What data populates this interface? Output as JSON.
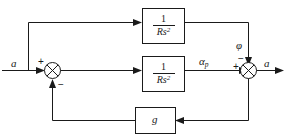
{
  "diagram": {
    "type": "control-system-block-diagram",
    "colors": {
      "line": "#1a1a1a",
      "background": "#ffffff"
    },
    "signals": {
      "input_label": "a",
      "intermediate_label": "α",
      "intermediate_subscript": "p",
      "disturbance_label": "φ",
      "output_label": "a"
    },
    "blocks": [
      {
        "id": "top-transfer-block",
        "numerator": "1",
        "denominator": "Rs",
        "denominator_exponent": "2",
        "label": "1/Rs²"
      },
      {
        "id": "middle-transfer-block",
        "numerator": "1",
        "denominator": "Rs",
        "denominator_exponent": "2",
        "label": "1/Rs²"
      },
      {
        "id": "feedback-gain-block",
        "label": "g"
      }
    ],
    "summing_junctions": [
      {
        "id": "left-summing-junction",
        "signs": [
          "+",
          "−"
        ],
        "input_sign": "+",
        "feedback_sign": "−"
      },
      {
        "id": "right-summing-junction",
        "signs": [
          "+",
          "−"
        ],
        "input_sign": "+",
        "disturbance_sign": "−"
      }
    ]
  }
}
